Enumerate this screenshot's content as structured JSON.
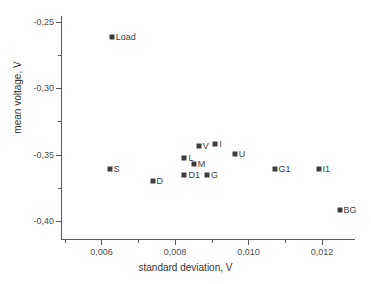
{
  "chart_data": {
    "type": "scatter",
    "title": "",
    "xlabel": "standard deviation, V",
    "ylabel": "mean voltage, V",
    "xlim": [
      0.0049,
      0.0129
    ],
    "ylim": [
      -0.4145,
      -0.2455
    ],
    "grid": false,
    "legend": null,
    "decimal_separator": ",",
    "xticks": [
      {
        "value": 0.006,
        "label": "0,006"
      },
      {
        "value": 0.008,
        "label": "0,008"
      },
      {
        "value": 0.01,
        "label": "0,010"
      },
      {
        "value": 0.012,
        "label": "0,012"
      }
    ],
    "xminorticks": [
      0.005,
      0.007,
      0.009,
      0.011
    ],
    "yticks": [
      {
        "value": -0.25,
        "label": "-0,25"
      },
      {
        "value": -0.3,
        "label": "-0,30"
      },
      {
        "value": -0.35,
        "label": "-0,35"
      },
      {
        "value": -0.4,
        "label": "-0,40"
      }
    ],
    "yminorticks": [
      -0.275,
      -0.325,
      -0.375
    ],
    "marker": "filled-square",
    "marker_color": "#3d3d3d",
    "points": [
      {
        "label": "Load",
        "x": 0.00628,
        "y": -0.2617,
        "label_side": "right"
      },
      {
        "label": "S",
        "x": 0.00622,
        "y": -0.3609,
        "label_side": "right"
      },
      {
        "label": "D",
        "x": 0.00739,
        "y": -0.3702,
        "label_side": "right"
      },
      {
        "label": "L",
        "x": 0.00826,
        "y": -0.353,
        "label_side": "right"
      },
      {
        "label": "D1",
        "x": 0.00826,
        "y": -0.3651,
        "label_side": "right"
      },
      {
        "label": "V",
        "x": 0.00865,
        "y": -0.3433,
        "label_side": "right"
      },
      {
        "label": "M",
        "x": 0.00851,
        "y": -0.3568,
        "label_side": "right"
      },
      {
        "label": "G",
        "x": 0.00887,
        "y": -0.3651,
        "label_side": "right"
      },
      {
        "label": "I",
        "x": 0.0091,
        "y": -0.3424,
        "label_side": "right"
      },
      {
        "label": "U",
        "x": 0.00963,
        "y": -0.3493,
        "label_side": "right"
      },
      {
        "label": "G1",
        "x": 0.01071,
        "y": -0.3609,
        "label_side": "right"
      },
      {
        "label": "I1",
        "x": 0.01191,
        "y": -0.3609,
        "label_side": "right"
      },
      {
        "label": "BG",
        "x": 0.01248,
        "y": -0.3915,
        "label_side": "right"
      }
    ]
  }
}
